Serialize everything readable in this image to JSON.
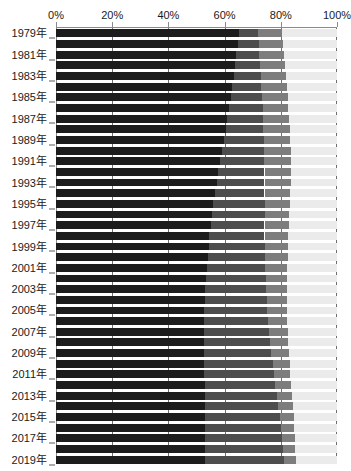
{
  "chart_data": {
    "type": "bar",
    "orientation": "horizontal",
    "stacked": true,
    "normalized_percent": true,
    "title": "",
    "subtitle": "",
    "xlabel": "",
    "ylabel": "",
    "xlim": [
      0,
      100
    ],
    "grid": true,
    "legend_position": "none",
    "xticks": [
      "0%",
      "20%",
      "40%",
      "60%",
      "80%",
      "100%"
    ],
    "xtick_values": [
      0,
      20,
      40,
      60,
      80,
      100
    ],
    "categories": [
      "1979年",
      "1980年",
      "1981年",
      "1982年",
      "1983年",
      "1984年",
      "1985年",
      "1986年",
      "1987年",
      "1988年",
      "1989年",
      "1990年",
      "1991年",
      "1992年",
      "1993年",
      "1994年",
      "1995年",
      "1996年",
      "1997年",
      "1998年",
      "1999年",
      "2000年",
      "2001年",
      "2002年",
      "2003年",
      "2004年",
      "2005年",
      "2006年",
      "2007年",
      "2008年",
      "2009年",
      "2010年",
      "2011年",
      "2012年",
      "2013年",
      "2014年",
      "2015年",
      "2016年",
      "2017年",
      "2018年",
      "2019年"
    ],
    "visible_tick_labels": [
      "1979年",
      "1981年",
      "1983年",
      "1985年",
      "1987年",
      "1989年",
      "1991年",
      "1993年",
      "1995年",
      "1997年",
      "1999年",
      "2001年",
      "2003年",
      "2005年",
      "2007年",
      "2009年",
      "2011年",
      "2013年",
      "2015年",
      "2017年",
      "2019年"
    ],
    "series": [
      {
        "name": "segment-1",
        "color": "#1c1c1c",
        "values": [
          65.0,
          64.6,
          64.2,
          63.8,
          63.3,
          62.8,
          62.3,
          61.7,
          61.0,
          60.4,
          59.7,
          59.0,
          58.4,
          57.8,
          57.2,
          56.6,
          56.0,
          55.5,
          55.0,
          54.6,
          54.3,
          54.0,
          53.7,
          53.4,
          53.2,
          53.0,
          52.8,
          52.7,
          52.6,
          52.6,
          52.6,
          52.7,
          52.8,
          52.9,
          53.0,
          53.1,
          53.2,
          53.2,
          53.2,
          53.2,
          53.1
        ]
      },
      {
        "name": "segment-2",
        "color": "#4d4d4d",
        "values": [
          7.0,
          7.6,
          8.2,
          8.9,
          9.6,
          10.3,
          11.0,
          11.8,
          12.6,
          13.4,
          14.2,
          15.0,
          15.7,
          16.4,
          17.0,
          17.6,
          18.2,
          18.7,
          19.2,
          19.6,
          20.0,
          20.4,
          20.8,
          21.2,
          21.6,
          22.0,
          22.4,
          22.8,
          23.2,
          23.6,
          24.0,
          24.4,
          24.8,
          25.2,
          25.6,
          26.0,
          26.4,
          26.8,
          27.2,
          27.6,
          28.0
        ]
      },
      {
        "name": "segment-3",
        "color": "#7d7d7d",
        "values": [
          8.5,
          8.6,
          8.7,
          8.8,
          8.9,
          9.0,
          9.1,
          9.2,
          9.3,
          9.4,
          9.5,
          9.5,
          9.5,
          9.4,
          9.3,
          9.2,
          9.0,
          8.8,
          8.6,
          8.4,
          8.2,
          8.0,
          7.8,
          7.6,
          7.4,
          7.2,
          7.0,
          6.8,
          6.6,
          6.4,
          6.2,
          6.0,
          5.8,
          5.6,
          5.4,
          5.2,
          5.0,
          4.8,
          4.6,
          4.4,
          4.2
        ]
      },
      {
        "name": "segment-4",
        "color": "#ebebeb",
        "values": [
          19.5,
          19.2,
          18.9,
          18.5,
          18.2,
          17.9,
          17.6,
          17.3,
          17.1,
          16.8,
          16.6,
          16.5,
          16.4,
          16.4,
          16.5,
          16.6,
          16.8,
          17.0,
          17.2,
          17.4,
          17.5,
          17.6,
          17.7,
          17.8,
          17.8,
          17.8,
          17.8,
          17.7,
          17.6,
          17.4,
          17.2,
          16.9,
          16.6,
          16.3,
          16.0,
          15.7,
          15.4,
          15.2,
          15.0,
          14.8,
          14.7
        ]
      }
    ]
  },
  "axis": {
    "tick_color": "#8a8a8a",
    "grid_color": "#6f6f6f",
    "label_color": "#1a1a1a"
  }
}
